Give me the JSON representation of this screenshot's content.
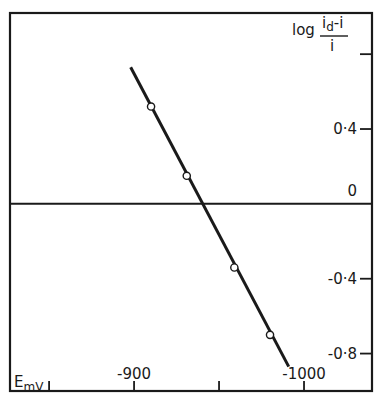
{
  "chart_data": {
    "type": "line",
    "title": "",
    "xlabel": "E",
    "xlabel_unit": "mV",
    "ylabel": "log (i_d - i) / i",
    "ylabel_parts": {
      "prefix": "log",
      "numerator_main": "i",
      "numerator_sub": "d",
      "numerator_rest": "-i",
      "denominator": "i"
    },
    "xlim": [
      -827,
      -1040
    ],
    "ylim": [
      -1.0,
      1.02
    ],
    "x_ticks": [
      {
        "value": -850,
        "label": ""
      },
      {
        "value": -900,
        "label": "-900"
      },
      {
        "value": -950,
        "label": ""
      },
      {
        "value": -1000,
        "label": "-1000"
      }
    ],
    "y_ticks": [
      {
        "value": 0.8,
        "label": ""
      },
      {
        "value": 0.4,
        "label": "0·4"
      },
      {
        "value": 0,
        "label": "0"
      },
      {
        "value": -0.4,
        "label": "-0·4"
      },
      {
        "value": -0.8,
        "label": "-0·8"
      }
    ],
    "grid": false,
    "zero_line": true,
    "series": [
      {
        "name": "measured",
        "marker": "open-circle",
        "points": [
          {
            "x": -910,
            "y": 0.52
          },
          {
            "x": -931,
            "y": 0.15
          },
          {
            "x": -959,
            "y": -0.34
          },
          {
            "x": -980,
            "y": -0.7
          }
        ]
      },
      {
        "name": "fit",
        "style": "solid-line",
        "points": [
          {
            "x": -898,
            "y": 0.73
          },
          {
            "x": -991,
            "y": -0.87
          }
        ]
      }
    ]
  }
}
